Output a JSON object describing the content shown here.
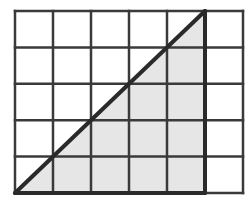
{
  "diagram": {
    "type": "grid-with-shaded-triangle",
    "grid": {
      "columns": 6,
      "rows": 5,
      "x_lines": [
        15,
        53,
        91,
        129,
        167,
        205,
        243
      ],
      "y_lines": [
        11,
        47.4,
        83.8,
        120.2,
        156.6,
        193
      ],
      "line_color": "#3a3a3a",
      "line_width": 2.5
    },
    "triangle": {
      "vertices": [
        [
          15,
          193
        ],
        [
          205,
          11
        ],
        [
          205,
          193
        ]
      ],
      "fill_color": "#e6e6e6",
      "stroke_color": "#2a2a2a",
      "stroke_width": 4,
      "base_cells": 5,
      "height_cells": 5
    },
    "background": "#ffffff"
  }
}
